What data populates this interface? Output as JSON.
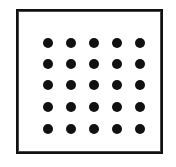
{
  "figure": {
    "background_color": "#ffffff",
    "frame": {
      "border_color": "#111111",
      "fill_color": "#ffffff",
      "border_width_px": 2,
      "x_px": 16,
      "y_px": 9,
      "width_px": 147,
      "height_px": 145
    },
    "dots": {
      "shape": "filled-circle",
      "color": "#111111",
      "diameter_px": 10,
      "rows": 5,
      "columns": 5,
      "count": 25,
      "column_centers_px": [
        30,
        53,
        76,
        99,
        122
      ],
      "row_centers_px": [
        32,
        53,
        74,
        96,
        118
      ],
      "grid": [
        [
          1,
          1,
          1,
          1,
          1
        ],
        [
          1,
          1,
          1,
          1,
          1
        ],
        [
          1,
          1,
          1,
          1,
          1
        ],
        [
          1,
          1,
          1,
          1,
          1
        ],
        [
          1,
          1,
          1,
          1,
          1
        ]
      ]
    }
  }
}
